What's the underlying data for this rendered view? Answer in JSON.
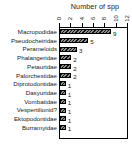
{
  "chart_data": {
    "type": "bar",
    "orientation": "horizontal",
    "title": "Number of spp",
    "xlabel": "Number of spp",
    "ylabel": "",
    "xlim": [
      0,
      12
    ],
    "grid": false,
    "legend": null,
    "axis_position": "top",
    "tick_label_rotation": 90,
    "xticks": [
      "0",
      "2",
      "4",
      "6",
      "8",
      "10",
      "12"
    ],
    "xtick_values": [
      0,
      2,
      4,
      6,
      8,
      10,
      12
    ],
    "categories": [
      "Macropodidae",
      "Pseudocheiridae",
      "Perameloids",
      "Phalangeridae",
      "Petauridae",
      "Palorchestidae",
      "Diprotodontidae",
      "Dasyuridae",
      "Vombatidae",
      "Vespertilionid?",
      "Ektopodontidae",
      "Burramyidae"
    ],
    "values": [
      9,
      5,
      3,
      2,
      2,
      2,
      1,
      1,
      1,
      1,
      1,
      1
    ],
    "data_labels": [
      "9",
      "5",
      "3",
      "2",
      "2",
      "2",
      "1",
      "1",
      "1",
      "1",
      "1",
      "1"
    ],
    "bar_fill_color": "#6e6e6e",
    "bar_edge_color": "#000000",
    "bar_hatch": "diagonal-stripes"
  }
}
